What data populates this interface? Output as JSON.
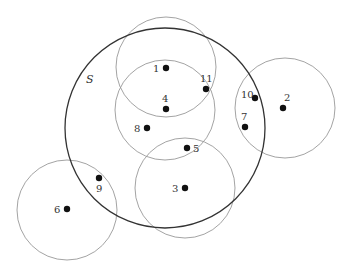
{
  "diagram": {
    "set_label": "S",
    "big_circle": {
      "name": "S",
      "cx": 165,
      "cy": 128,
      "r": 100,
      "stroke": "#333333",
      "stroke_width": 1.3
    },
    "circles": [
      {
        "id": "c1",
        "cx": 166,
        "cy": 67,
        "r": 50
      },
      {
        "id": "c4",
        "cx": 165,
        "cy": 110,
        "r": 50
      },
      {
        "id": "c3",
        "cx": 185,
        "cy": 188,
        "r": 50
      },
      {
        "id": "c2",
        "cx": 285,
        "cy": 108,
        "r": 50
      },
      {
        "id": "c6",
        "cx": 67,
        "cy": 210,
        "r": 50
      }
    ],
    "circle_stroke": "#999999",
    "point_color": "#111111",
    "points": [
      {
        "label": "1",
        "x": 166,
        "y": 68,
        "lx": 153,
        "ly": 72
      },
      {
        "label": "2",
        "x": 283,
        "y": 108,
        "lx": 284,
        "ly": 101
      },
      {
        "label": "3",
        "x": 185,
        "y": 188,
        "lx": 172,
        "ly": 192
      },
      {
        "label": "4",
        "x": 166,
        "y": 109,
        "lx": 162,
        "ly": 102
      },
      {
        "label": "5",
        "x": 187,
        "y": 148,
        "lx": 193,
        "ly": 152
      },
      {
        "label": "6",
        "x": 67,
        "y": 209,
        "lx": 54,
        "ly": 213
      },
      {
        "label": "7",
        "x": 245,
        "y": 127,
        "lx": 241,
        "ly": 120
      },
      {
        "label": "8",
        "x": 147,
        "y": 128,
        "lx": 134,
        "ly": 132
      },
      {
        "label": "9",
        "x": 99,
        "y": 178,
        "lx": 96,
        "ly": 192
      },
      {
        "label": "10",
        "x": 255,
        "y": 98,
        "lx": 241,
        "ly": 98
      },
      {
        "label": "11",
        "x": 206,
        "y": 89,
        "lx": 200,
        "ly": 82
      }
    ],
    "set_label_pos": {
      "x": 86,
      "y": 83
    }
  }
}
